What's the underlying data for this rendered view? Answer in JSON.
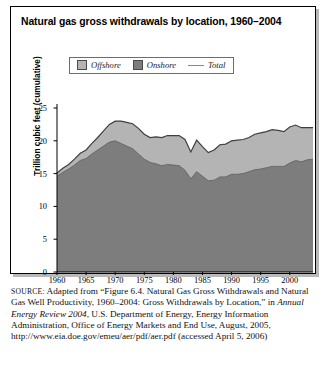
{
  "figure": {
    "title": "Natural gas gross withdrawals by location, 1960–2004"
  },
  "legend": {
    "items": [
      {
        "label": "Offshore",
        "swatch": "square-swatch-light",
        "color": "#b4b4b4"
      },
      {
        "label": "Onshore",
        "swatch": "square-swatch-dark",
        "color": "#7d7d7d"
      },
      {
        "label": "Total",
        "swatch": "line-swatch",
        "color": "#8a8a8a"
      }
    ]
  },
  "source_note": {
    "label": "SOURCE:",
    "part1": " Adapted from “Figure 6.4. Natural Gas Gross Withdrawals and Natural Gas Well Productivity, 1960–2004: Gross Withdrawals by Location,” in ",
    "italic1": "Annual Energy Review 2004",
    "part2": ", U.S. Department of Energy, Energy Information Administration, Office of Energy Markets and End Use, August, 2005, http://www.eia.doe.gov/emeu/aer/pdf/aer.pdf (accessed April 5, 2006)"
  },
  "chart_data": {
    "type": "area",
    "title": "Natural gas gross withdrawals by location, 1960–2004",
    "xlabel": "",
    "ylabel": "Trillion cubic feet (cumulative)",
    "xlim": [
      1960,
      2004
    ],
    "ylim": [
      0,
      25
    ],
    "yticks": [
      0,
      5,
      10,
      15,
      20,
      25
    ],
    "xticks": [
      1960,
      1965,
      1970,
      1975,
      1980,
      1985,
      1990,
      1995,
      2000
    ],
    "grid": false,
    "legend_position": "top-center",
    "stacked": true,
    "x": [
      1960,
      1961,
      1962,
      1963,
      1964,
      1965,
      1966,
      1967,
      1968,
      1969,
      1970,
      1971,
      1972,
      1973,
      1974,
      1975,
      1976,
      1977,
      1978,
      1979,
      1980,
      1981,
      1982,
      1983,
      1984,
      1985,
      1986,
      1987,
      1988,
      1989,
      1990,
      1991,
      1992,
      1993,
      1994,
      1995,
      1996,
      1997,
      1998,
      1999,
      2000,
      2001,
      2002,
      2003,
      2004
    ],
    "series": [
      {
        "name": "Onshore",
        "color": "#7d7d7d",
        "values": [
          14.6,
          15.2,
          15.7,
          16.3,
          17.0,
          17.3,
          18.0,
          18.6,
          19.2,
          19.8,
          20.0,
          19.6,
          19.2,
          18.8,
          18.0,
          17.2,
          16.7,
          16.5,
          16.2,
          16.4,
          16.3,
          16.2,
          15.5,
          14.2,
          15.3,
          14.6,
          13.9,
          14.0,
          14.5,
          14.5,
          14.9,
          14.9,
          15.0,
          15.3,
          15.6,
          15.7,
          15.9,
          16.1,
          16.1,
          16.1,
          16.6,
          17.0,
          16.8,
          17.1,
          17.2
        ]
      },
      {
        "name": "Offshore",
        "color": "#b4b4b4",
        "values": [
          0.5,
          0.6,
          0.7,
          0.9,
          1.1,
          1.3,
          1.6,
          1.9,
          2.3,
          2.7,
          3.0,
          3.4,
          3.6,
          3.8,
          3.9,
          3.8,
          3.8,
          4.1,
          4.3,
          4.4,
          4.5,
          4.6,
          4.7,
          4.1,
          4.8,
          4.5,
          4.3,
          4.6,
          4.9,
          5.0,
          5.1,
          5.2,
          5.2,
          5.2,
          5.4,
          5.5,
          5.5,
          5.6,
          5.5,
          5.3,
          5.5,
          5.4,
          5.2,
          4.9,
          4.8
        ]
      }
    ],
    "total": {
      "name": "Total",
      "color": "#8a8a8a",
      "values": [
        15.1,
        15.8,
        16.4,
        17.2,
        18.1,
        18.6,
        19.6,
        20.5,
        21.5,
        22.5,
        23.0,
        23.0,
        22.8,
        22.6,
        21.9,
        21.0,
        20.5,
        20.6,
        20.5,
        20.8,
        20.8,
        20.8,
        20.2,
        18.3,
        20.1,
        19.1,
        18.2,
        18.6,
        19.4,
        19.5,
        20.0,
        20.1,
        20.2,
        20.5,
        21.0,
        21.2,
        21.4,
        21.7,
        21.6,
        21.4,
        22.1,
        22.4,
        22.0,
        22.0,
        22.0
      ]
    }
  }
}
